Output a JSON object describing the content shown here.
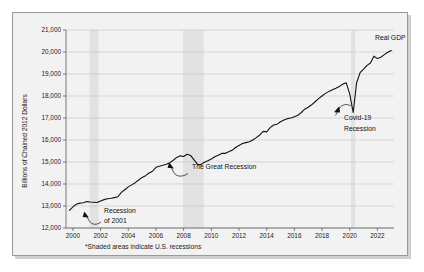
{
  "figure": {
    "footnote": "*Shaded areas indicate U.S. recessions",
    "background_color": "#f2f2f2",
    "border_color": "#9a9a9a"
  },
  "chart_data": {
    "type": "line",
    "title": "",
    "xlabel": "",
    "ylabel": "Billions of Chained 2012 Dollars",
    "xlim": [
      1999.5,
      2023.2
    ],
    "ylim": [
      12000,
      21000
    ],
    "grid": true,
    "legend_position": "inline-right",
    "series_color": "#111111",
    "x_ticks": [
      "2000",
      "2002",
      "2004",
      "2006",
      "2008",
      "2010",
      "2012",
      "2014",
      "2016",
      "2018",
      "2020",
      "2022"
    ],
    "x_tick_values": [
      2000,
      2002,
      2004,
      2006,
      2008,
      2010,
      2012,
      2014,
      2016,
      2018,
      2020,
      2022
    ],
    "y_ticks": [
      "12,000",
      "13,000",
      "14,000",
      "15,000",
      "16,000",
      "17,000",
      "18,000",
      "19,000",
      "20,000",
      "21,000"
    ],
    "y_tick_values": [
      12000,
      13000,
      14000,
      15000,
      16000,
      17000,
      18000,
      19000,
      20000,
      21000
    ],
    "series": [
      {
        "name": "Real GDP",
        "x": [
          1999.75,
          2000.0,
          2000.25,
          2000.5,
          2000.75,
          2001.0,
          2001.25,
          2001.5,
          2001.75,
          2002.0,
          2002.25,
          2002.5,
          2002.75,
          2003.0,
          2003.25,
          2003.5,
          2003.75,
          2004.0,
          2004.25,
          2004.5,
          2004.75,
          2005.0,
          2005.25,
          2005.5,
          2005.75,
          2006.0,
          2006.25,
          2006.5,
          2006.75,
          2007.0,
          2007.25,
          2007.5,
          2007.75,
          2008.0,
          2008.25,
          2008.5,
          2008.75,
          2009.0,
          2009.25,
          2009.5,
          2009.75,
          2010.0,
          2010.25,
          2010.5,
          2010.75,
          2011.0,
          2011.25,
          2011.5,
          2011.75,
          2012.0,
          2012.25,
          2012.5,
          2012.75,
          2013.0,
          2013.25,
          2013.5,
          2013.75,
          2014.0,
          2014.25,
          2014.5,
          2014.75,
          2015.0,
          2015.25,
          2015.5,
          2015.75,
          2016.0,
          2016.25,
          2016.5,
          2016.75,
          2017.0,
          2017.25,
          2017.5,
          2017.75,
          2018.0,
          2018.25,
          2018.5,
          2018.75,
          2019.0,
          2019.25,
          2019.5,
          2019.75,
          2020.0,
          2020.25,
          2020.5,
          2020.75,
          2021.0,
          2021.25,
          2021.5,
          2021.75,
          2022.0,
          2022.25,
          2022.5,
          2022.75,
          2023.0
        ],
        "values": [
          12800,
          12960,
          13080,
          13130,
          13150,
          13200,
          13180,
          13170,
          13160,
          13230,
          13290,
          13330,
          13350,
          13380,
          13420,
          13620,
          13740,
          13870,
          13960,
          14060,
          14180,
          14300,
          14380,
          14500,
          14580,
          14760,
          14810,
          14850,
          14900,
          14970,
          15080,
          15210,
          15280,
          15250,
          15350,
          15300,
          15100,
          14900,
          14880,
          14990,
          15060,
          15140,
          15240,
          15310,
          15390,
          15390,
          15470,
          15530,
          15660,
          15750,
          15840,
          15880,
          15920,
          16000,
          16110,
          16230,
          16390,
          16370,
          16560,
          16680,
          16720,
          16830,
          16910,
          16970,
          17000,
          17060,
          17120,
          17250,
          17400,
          17490,
          17600,
          17740,
          17880,
          18000,
          18120,
          18210,
          18280,
          18350,
          18430,
          18540,
          18600,
          18100,
          17250,
          18600,
          19060,
          19220,
          19390,
          19500,
          19810,
          19700,
          19760,
          19880,
          19990,
          20070
        ],
        "label": "Real GDP"
      }
    ],
    "recession_bands": [
      {
        "name": "Recession of 2001",
        "start": 2001.2,
        "end": 2001.85
      },
      {
        "name": "The Great Recession",
        "start": 2007.95,
        "end": 2009.45
      },
      {
        "name": "Covid-19 Recession",
        "start": 2020.1,
        "end": 2020.4
      }
    ],
    "annotations": [
      {
        "name": "recession-2001",
        "line1": "Recession",
        "line2": "of 2001"
      },
      {
        "name": "great-recession",
        "line1": "The Great Recession",
        "line2": ""
      },
      {
        "name": "covid-recession",
        "line1": "Covid-19",
        "line2": "Recession"
      },
      {
        "name": "series-label",
        "line1": "Real GDP",
        "line2": ""
      }
    ]
  }
}
